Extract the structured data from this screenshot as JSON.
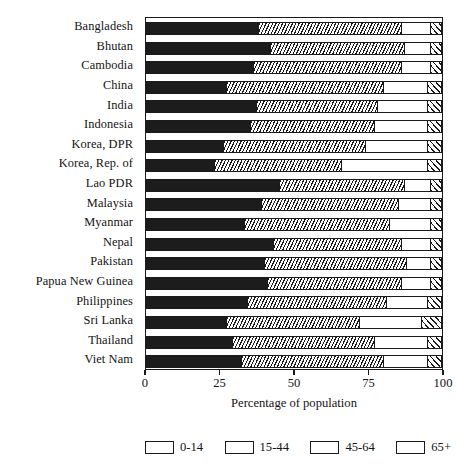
{
  "chart_data": {
    "type": "bar",
    "orientation": "horizontal",
    "stacked": true,
    "title": "",
    "xlabel": "Percentage of population",
    "ylabel": "",
    "xlim": [
      0,
      100
    ],
    "xticks": [
      0,
      25,
      50,
      75,
      100
    ],
    "xticklabels": [
      "0",
      "25",
      "50",
      "75",
      "100"
    ],
    "grid": false,
    "legend_position": "bottom",
    "categories": [
      "Bangladesh",
      "Bhutan",
      "Cambodia",
      "China",
      "India",
      "Indonesia",
      "Korea, DPR",
      "Korea, Rep. of",
      "Lao PDR",
      "Malaysia",
      "Myanmar",
      "Nepal",
      "Pakistan",
      "Papua New Guinea",
      "Philippines",
      "Sri Lanka",
      "Thailand",
      "Viet Nam"
    ],
    "series": [
      {
        "name": "0-14",
        "pattern": "solid-black",
        "color": "#1c1c1c",
        "values": [
          38,
          42,
          36,
          27,
          37,
          35,
          26,
          23,
          45,
          39,
          33,
          43,
          40,
          41,
          34,
          27,
          29,
          32
        ]
      },
      {
        "name": "15-44",
        "pattern": "dense-backslash-hatch",
        "color": "#ffffff",
        "values": [
          48,
          45,
          50,
          53,
          41,
          42,
          48,
          43,
          42,
          46,
          49,
          43,
          48,
          45,
          47,
          45,
          48,
          48
        ]
      },
      {
        "name": "45-64",
        "pattern": "white",
        "color": "#ffffff",
        "values": [
          10,
          9,
          10,
          15,
          17,
          18,
          21,
          29,
          9,
          11,
          14,
          10,
          8,
          10,
          14,
          21,
          18,
          15
        ]
      },
      {
        "name": "65+",
        "pattern": "wide-slash-hatch",
        "color": "#ffffff",
        "values": [
          4,
          4,
          4,
          5,
          5,
          5,
          5,
          5,
          4,
          4,
          4,
          4,
          4,
          4,
          5,
          7,
          5,
          5
        ]
      }
    ]
  },
  "legend": {
    "items": [
      {
        "label": "0-14"
      },
      {
        "label": "15-44"
      },
      {
        "label": "45-64"
      },
      {
        "label": "65+"
      }
    ]
  }
}
